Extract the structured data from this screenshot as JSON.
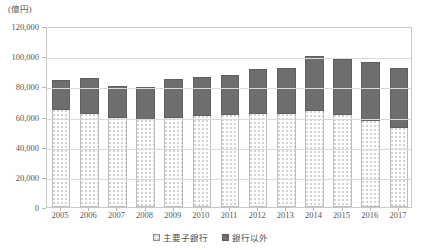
{
  "chart_data": {
    "type": "bar",
    "stacked": true,
    "title": "",
    "subtitle": "",
    "unit_label": "(億円)",
    "xlabel": "",
    "ylabel": "",
    "ylim": [
      0,
      120000
    ],
    "ytick_step": 20000,
    "yticks": [
      0,
      20000,
      40000,
      60000,
      80000,
      100000,
      120000
    ],
    "ytick_labels": [
      "0",
      "20,000",
      "40,000",
      "60,000",
      "80,000",
      "100,000",
      "120,000"
    ],
    "grid": true,
    "grid_axis": "y",
    "legend_position": "bottom",
    "categories": [
      "2005",
      "2006",
      "2007",
      "2008",
      "2009",
      "2010",
      "2011",
      "2012",
      "2013",
      "2014",
      "2015",
      "2016",
      "2017"
    ],
    "series": [
      {
        "name": "主要子銀行",
        "fill": "dotted-white",
        "color": "#ffffff",
        "values": [
          65000,
          62500,
          59500,
          58500,
          60000,
          61000,
          61500,
          62000,
          62500,
          64000,
          61500,
          58000,
          53000
        ]
      },
      {
        "name": "銀行以外",
        "fill": "solid-gray",
        "color": "#6e6e6e",
        "values": [
          20000,
          23500,
          21500,
          21500,
          25500,
          26000,
          27000,
          30000,
          30500,
          36500,
          37500,
          38500,
          40000
        ]
      }
    ],
    "totals": [
      85000,
      86000,
      81000,
      80000,
      85500,
      87000,
      88500,
      92000,
      93000,
      100500,
      99000,
      96500,
      93000
    ]
  }
}
